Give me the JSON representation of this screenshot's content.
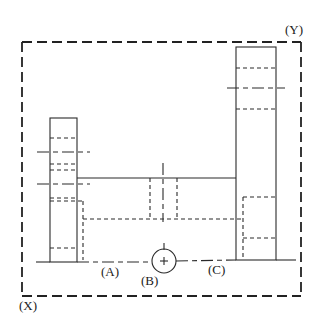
{
  "diagram": {
    "type": "technical-drawing",
    "labels": {
      "X": "(X)",
      "Y": "(Y)",
      "A": "(A)",
      "B": "(B)",
      "C": "(C)"
    },
    "line_color": "#2a2a2a",
    "background": "#ffffff"
  }
}
